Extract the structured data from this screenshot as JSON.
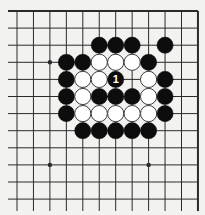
{
  "board": {
    "grid": {
      "columns": 12,
      "rows": 12,
      "x0": 17,
      "dx": 16.45,
      "y0": 11,
      "dy": 17.1,
      "left_extension_x": 8,
      "bottom_extension_y": 211,
      "edges": [
        "top",
        "right"
      ]
    },
    "colors": {
      "paper": "#f2f2f0",
      "line": "#2a2a2a",
      "black_stone": "#0d0d0d",
      "white_stone": "#ffffff",
      "stone_outline": "#3a3a3a",
      "label_on_black": "#ffffff"
    },
    "star_points": [
      {
        "col": 2,
        "row": 3
      },
      {
        "col": 2,
        "row": 9
      },
      {
        "col": 8,
        "row": 9
      }
    ],
    "stones": [
      {
        "col": 5,
        "row": 2,
        "color": "black"
      },
      {
        "col": 6,
        "row": 2,
        "color": "black"
      },
      {
        "col": 7,
        "row": 2,
        "color": "black"
      },
      {
        "col": 9,
        "row": 2,
        "color": "black"
      },
      {
        "col": 3,
        "row": 3,
        "color": "black"
      },
      {
        "col": 4,
        "row": 3,
        "color": "black"
      },
      {
        "col": 5,
        "row": 3,
        "color": "white"
      },
      {
        "col": 6,
        "row": 3,
        "color": "white"
      },
      {
        "col": 7,
        "row": 3,
        "color": "white"
      },
      {
        "col": 8,
        "row": 3,
        "color": "black"
      },
      {
        "col": 3,
        "row": 4,
        "color": "black"
      },
      {
        "col": 4,
        "row": 4,
        "color": "white"
      },
      {
        "col": 5,
        "row": 4,
        "color": "white"
      },
      {
        "col": 6,
        "row": 4,
        "color": "black",
        "label": "1"
      },
      {
        "col": 8,
        "row": 4,
        "color": "white"
      },
      {
        "col": 9,
        "row": 4,
        "color": "black"
      },
      {
        "col": 3,
        "row": 5,
        "color": "black"
      },
      {
        "col": 4,
        "row": 5,
        "color": "white"
      },
      {
        "col": 5,
        "row": 5,
        "color": "black"
      },
      {
        "col": 6,
        "row": 5,
        "color": "black"
      },
      {
        "col": 7,
        "row": 5,
        "color": "black"
      },
      {
        "col": 8,
        "row": 5,
        "color": "white"
      },
      {
        "col": 9,
        "row": 5,
        "color": "black"
      },
      {
        "col": 3,
        "row": 6,
        "color": "black"
      },
      {
        "col": 4,
        "row": 6,
        "color": "white"
      },
      {
        "col": 5,
        "row": 6,
        "color": "white"
      },
      {
        "col": 6,
        "row": 6,
        "color": "white"
      },
      {
        "col": 7,
        "row": 6,
        "color": "white"
      },
      {
        "col": 8,
        "row": 6,
        "color": "white"
      },
      {
        "col": 9,
        "row": 6,
        "color": "black"
      },
      {
        "col": 4,
        "row": 7,
        "color": "black"
      },
      {
        "col": 5,
        "row": 7,
        "color": "black"
      },
      {
        "col": 6,
        "row": 7,
        "color": "black"
      },
      {
        "col": 7,
        "row": 7,
        "color": "black"
      },
      {
        "col": 8,
        "row": 7,
        "color": "black"
      }
    ]
  }
}
